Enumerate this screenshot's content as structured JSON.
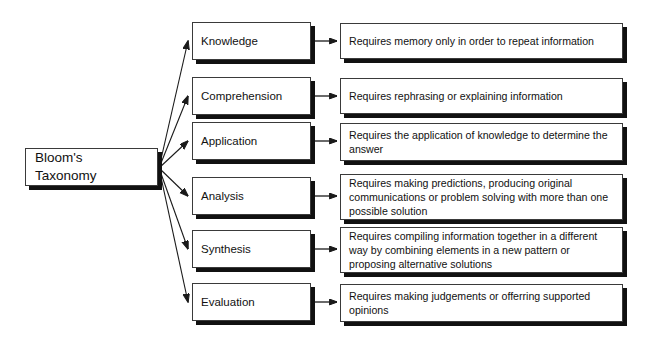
{
  "diagram": {
    "title": "Bloom's Taxonomy",
    "root": {
      "label": "Bloom's\nTaxonomy"
    },
    "levels": [
      {
        "name": "knowledge",
        "label": "Knowledge",
        "description": "Requires memory only in order to repeat information"
      },
      {
        "name": "comprehension",
        "label": "Comprehension",
        "description": "Requires rephrasing or explaining information"
      },
      {
        "name": "application",
        "label": "Application",
        "description": "Requires the application of knowledge to determine the answer"
      },
      {
        "name": "analysis",
        "label": "Analysis",
        "description": "Requires making predictions, producing original communications or problem solving with more than one possible solution"
      },
      {
        "name": "synthesis",
        "label": "Synthesis",
        "description": "Requires compiling information together in a different way by combining elements in a new pattern or proposing alternative solutions"
      },
      {
        "name": "evaluation",
        "label": "Evaluation",
        "description": "Requires making judgements or offerring supported opinions"
      }
    ],
    "colors": {
      "background": "#ffffff",
      "box_fill": "#ffffff",
      "box_border": "#3a3a3a",
      "shadow": "#111111",
      "text": "#111111",
      "connector": "#1a1a1a"
    }
  }
}
